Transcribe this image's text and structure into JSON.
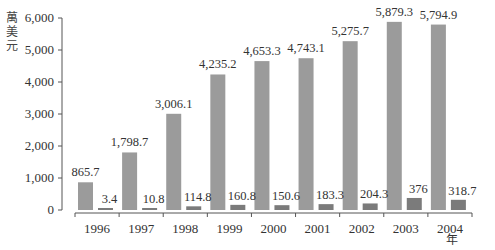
{
  "chart_data": {
    "type": "bar",
    "title": "",
    "xlabel": "年",
    "ylabel": "萬美元",
    "ylim": [
      0,
      6000
    ],
    "yticks": [
      0,
      1000,
      2000,
      3000,
      4000,
      5000,
      6000
    ],
    "ytick_labels": [
      "0",
      "1,000",
      "2,000",
      "3,000",
      "4,000",
      "5,000",
      "6,000"
    ],
    "grid": false,
    "legend": null,
    "categories": [
      "1996",
      "1997",
      "1998",
      "1999",
      "2000",
      "2001",
      "2002",
      "2003",
      "2004"
    ],
    "series": [
      {
        "name": "series-1",
        "color": "#9b9b9b",
        "values": [
          865.7,
          1798.7,
          3006.1,
          4235.2,
          4653.3,
          4743.1,
          5275.7,
          5879.3,
          5794.9
        ],
        "labels": [
          "865.7",
          "1,798.7",
          "3,006.1",
          "4,235.2",
          "4,653.3",
          "4,743.1",
          "5,275.7",
          "5,879.3",
          "5,794.9"
        ]
      },
      {
        "name": "series-2",
        "color": "#7b7b7b",
        "values": [
          3.4,
          10.8,
          114.8,
          160.8,
          150.6,
          183.3,
          204.3,
          376,
          318.7
        ],
        "labels": [
          "3.4",
          "10.8",
          "114.8",
          "160.8",
          "150.6",
          "183.3",
          "204.3",
          "376",
          "318.7"
        ]
      }
    ]
  }
}
